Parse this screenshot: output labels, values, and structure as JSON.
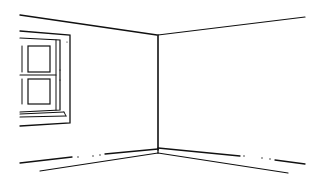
{
  "scene": {
    "description": "Line drawing of an empty room corner with a window on the left wall",
    "colors": {
      "ink": "#111111",
      "background": "#ffffff"
    }
  }
}
